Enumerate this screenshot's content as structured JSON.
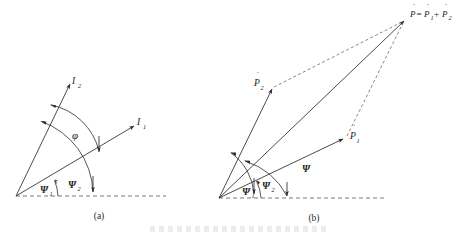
{
  "figure": {
    "title_hidden_caption": "",
    "panels": [
      {
        "id": "a",
        "caption": "(a)",
        "vectors": [
          {
            "name": "I1",
            "label_base": "I",
            "label_sub": "1"
          },
          {
            "name": "I2",
            "label_base": "I",
            "label_sub": "2"
          }
        ],
        "angles": [
          {
            "name": "psi1",
            "label_base": "Ψ",
            "label_sub": "1"
          },
          {
            "name": "psi2",
            "label_base": "Ψ",
            "label_sub": "2"
          },
          {
            "name": "phi",
            "label_base": "φ",
            "label_sub": ""
          }
        ]
      },
      {
        "id": "b",
        "caption": "(b)",
        "vectors": [
          {
            "name": "P1",
            "label_base": "P",
            "label_sub": "1",
            "dot": "˙"
          },
          {
            "name": "P2",
            "label_base": "P",
            "label_sub": "2",
            "dot": "˙"
          }
        ],
        "resultant": {
          "name": "P-resultant",
          "p": "P",
          "equals": "=",
          "p1": "P",
          "sub1": "1",
          "plus": "+",
          "p2": "P",
          "sub2": "2",
          "dot": "˙"
        },
        "angles": [
          {
            "name": "psi1",
            "label_base": "Ψ",
            "label_sub": "1"
          },
          {
            "name": "psi2",
            "label_base": "Ψ",
            "label_sub": "2"
          },
          {
            "name": "psi",
            "label_base": "Ψ",
            "label_sub": ""
          }
        ]
      }
    ],
    "colors": {
      "ink": "#2b2b2b",
      "dash": "#555555",
      "background": "#ffffff"
    }
  }
}
